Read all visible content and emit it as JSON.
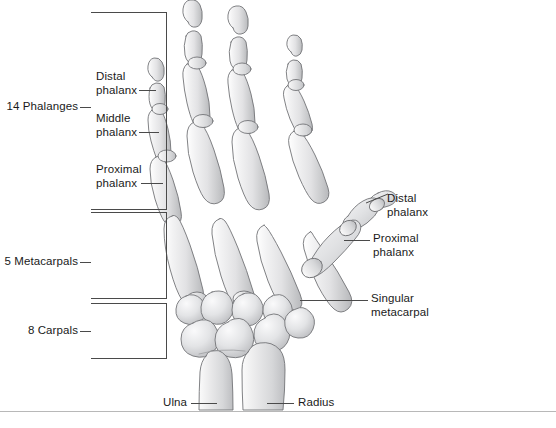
{
  "figure": {
    "credit": "© Cengage Learning 2014",
    "footer_partial": "",
    "colors": {
      "bone_fill": "#e9e9ea",
      "bone_shade": "#c3c4c6",
      "bone_outline": "#6f7072",
      "line": "#4a4a4a",
      "text": "#1a1a1a",
      "rule": "#b8b8b8",
      "credit_text": "#9a9a9a"
    }
  },
  "brackets": [
    {
      "name": "phalanges",
      "label": "14 Phalanges"
    },
    {
      "name": "metacarpals",
      "label": "5 Metacarpals"
    },
    {
      "name": "carpals",
      "label": "8 Carpals"
    }
  ],
  "labels": {
    "distal_phalanx_left": "Distal\nphalanx",
    "middle_phalanx": "Middle\nphalanx",
    "proximal_phalanx_left": "Proximal\nphalanx",
    "distal_phalanx_thumb": "Distal\nphalanx",
    "proximal_phalanx_thumb": "Proximal\nphalanx",
    "singular_metacarpal": "Singular\nmetacarpal",
    "ulna": "Ulna",
    "radius": "Radius"
  }
}
